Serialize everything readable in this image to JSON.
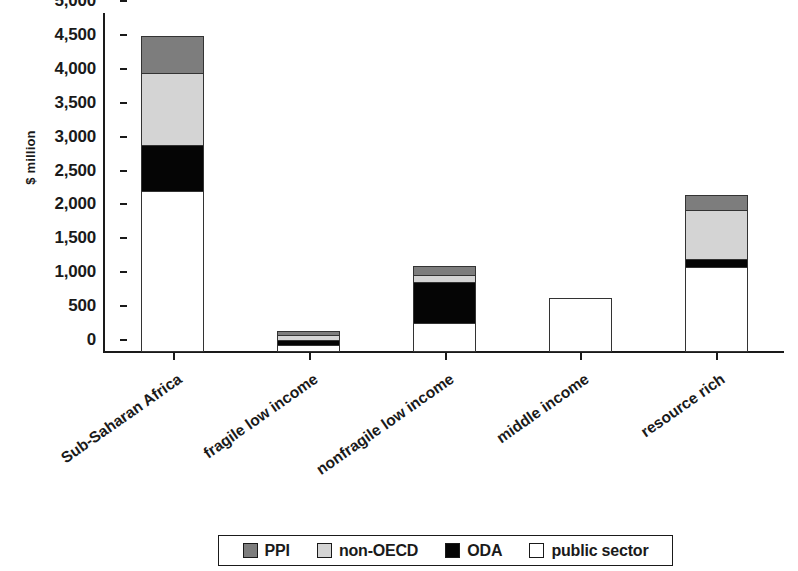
{
  "chart_data": {
    "type": "bar",
    "stacked": true,
    "title": "",
    "subtitle": "",
    "xlabel": "",
    "ylabel": "$ million",
    "ylim": [
      0,
      5000
    ],
    "ytick_step": 500,
    "grid": false,
    "legend_position": "bottom",
    "categories": [
      "Sub-Saharan Africa",
      "fragile low income",
      "nonfragile low income",
      "middle income",
      "resource rich"
    ],
    "ytick_labels": [
      "0",
      "500",
      "1,000",
      "1,500",
      "2,000",
      "2,500",
      "3,000",
      "3,500",
      "4,000",
      "4,500",
      "5,000"
    ],
    "series": [
      {
        "name": "public sector",
        "color": "#ffffff",
        "values": [
          2380,
          100,
          420,
          800,
          1250
        ]
      },
      {
        "name": "ODA",
        "color": "#050505",
        "values": [
          680,
          75,
          620,
          0,
          120
        ]
      },
      {
        "name": "non-OECD",
        "color": "#d4d4d4",
        "values": [
          1070,
          90,
          110,
          0,
          730
        ]
      },
      {
        "name": "PPI",
        "color": "#7d7d7d",
        "values": [
          530,
          45,
          120,
          0,
          210
        ]
      }
    ],
    "totals": [
      4660,
      310,
      1270,
      800,
      2310
    ]
  },
  "legend": {
    "items": [
      {
        "label": "PPI",
        "swatch": "ppi"
      },
      {
        "label": "non-OECD",
        "swatch": "nonoecd"
      },
      {
        "label": "ODA",
        "swatch": "oda"
      },
      {
        "label": "public sector",
        "swatch": "public"
      }
    ]
  }
}
